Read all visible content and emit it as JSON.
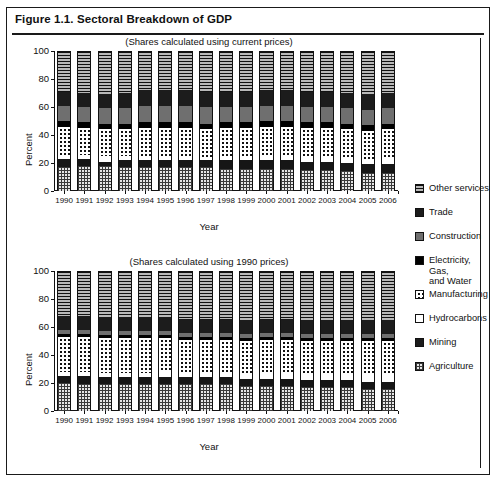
{
  "figure": {
    "title": "Figure 1.1. Sectoral Breakdown of GDP",
    "xlabel": "Year",
    "ylabel": "Percent"
  },
  "legend": {
    "title": "",
    "entries": [
      {
        "label": "Other services",
        "pattern": "horizontal-lines",
        "color": "#b9b9b9"
      },
      {
        "label": "Trade",
        "pattern": "solid-dark",
        "color": "#1c1c1c"
      },
      {
        "label": "Construction",
        "pattern": "solid-gray",
        "color": "#6f6f6f"
      },
      {
        "label": "Electricity, Gas,\nand Water",
        "pattern": "solid-black",
        "color": "#000000"
      },
      {
        "label": "Manufacturing",
        "pattern": "dots",
        "color": "#ffffff"
      },
      {
        "label": "Hydrocarbons",
        "pattern": "white",
        "color": "#ffffff"
      },
      {
        "label": "Mining",
        "pattern": "solid-dark",
        "color": "#161616"
      },
      {
        "label": "Agriculture",
        "pattern": "grid",
        "color": "#e6e6e6"
      }
    ]
  },
  "chart_data": [
    {
      "type": "bar",
      "stacked": true,
      "title": "(Shares calculated using current prices)",
      "xlabel": "Year",
      "ylabel": "Percent",
      "ylim": [
        0,
        100
      ],
      "yticks": [
        0,
        20,
        40,
        60,
        80,
        100
      ],
      "grid": false,
      "legend_position": "right",
      "categories": [
        "1990",
        "1991",
        "1992",
        "1993",
        "1994",
        "1995",
        "1996",
        "1997",
        "1998",
        "1999",
        "2000",
        "2001",
        "2002",
        "2003",
        "2004",
        "2005",
        "2006"
      ],
      "series": [
        {
          "name": "Agriculture",
          "values": [
            17,
            18,
            18,
            17,
            17,
            17,
            17,
            17,
            16,
            16,
            16,
            16,
            15,
            15,
            14,
            13,
            13
          ]
        },
        {
          "name": "Mining",
          "values": [
            6,
            5,
            3,
            5,
            5,
            5,
            5,
            5,
            6,
            6,
            6,
            6,
            6,
            6,
            6,
            6,
            6
          ]
        },
        {
          "name": "Hydrocarbons",
          "values": [
            3,
            3,
            4,
            3,
            3,
            3,
            3,
            2,
            2,
            2,
            3,
            3,
            3,
            3,
            4,
            4,
            5
          ]
        },
        {
          "name": "Manufacturing",
          "values": [
            20,
            19,
            19,
            19,
            20,
            20,
            20,
            20,
            21,
            21,
            21,
            21,
            21,
            21,
            20,
            20,
            20
          ]
        },
        {
          "name": "Electricity, Gas, and Water",
          "values": [
            4,
            4,
            4,
            4,
            4,
            4,
            4,
            4,
            4,
            4,
            4,
            4,
            4,
            4,
            4,
            4,
            4
          ]
        },
        {
          "name": "Construction",
          "values": [
            11,
            11,
            11,
            11,
            12,
            12,
            12,
            12,
            11,
            11,
            11,
            11,
            11,
            11,
            11,
            11,
            11
          ]
        },
        {
          "name": "Trade",
          "values": [
            10,
            10,
            10,
            11,
            11,
            11,
            11,
            11,
            11,
            11,
            11,
            11,
            11,
            11,
            11,
            11,
            11
          ]
        },
        {
          "name": "Other services",
          "values": [
            29,
            30,
            31,
            30,
            28,
            28,
            28,
            29,
            29,
            29,
            28,
            28,
            29,
            29,
            30,
            31,
            30
          ]
        }
      ]
    },
    {
      "type": "bar",
      "stacked": true,
      "title": "(Shares calculated using 1990 prices)",
      "xlabel": "Year",
      "ylabel": "Percent",
      "ylim": [
        0,
        100
      ],
      "yticks": [
        0,
        20,
        40,
        60,
        80,
        100
      ],
      "grid": false,
      "legend_position": "right",
      "categories": [
        "1990",
        "1991",
        "1992",
        "1993",
        "1994",
        "1995",
        "1996",
        "1997",
        "1998",
        "1999",
        "2000",
        "2001",
        "2002",
        "2003",
        "2004",
        "2005",
        "2006"
      ],
      "series": [
        {
          "name": "Agriculture",
          "values": [
            20,
            19,
            19,
            19,
            19,
            19,
            19,
            19,
            19,
            18,
            18,
            18,
            17,
            17,
            17,
            16,
            16
          ]
        },
        {
          "name": "Mining",
          "values": [
            5,
            6,
            5,
            5,
            5,
            5,
            5,
            5,
            5,
            5,
            5,
            5,
            5,
            5,
            5,
            5,
            5
          ]
        },
        {
          "name": "Hydrocarbons",
          "values": [
            3,
            3,
            3,
            3,
            3,
            4,
            3,
            3,
            3,
            3,
            4,
            4,
            4,
            4,
            4,
            5,
            5
          ]
        },
        {
          "name": "Manufacturing",
          "values": [
            25,
            25,
            25,
            25,
            25,
            24,
            24,
            24,
            24,
            24,
            24,
            24,
            24,
            24,
            24,
            24,
            24
          ]
        },
        {
          "name": "Electricity, Gas, and Water",
          "values": [
            2,
            2,
            2,
            2,
            2,
            2,
            2,
            2,
            2,
            2,
            2,
            2,
            2,
            2,
            2,
            2,
            2
          ]
        },
        {
          "name": "Construction",
          "values": [
            3,
            3,
            3,
            3,
            3,
            3,
            3,
            3,
            3,
            3,
            3,
            3,
            3,
            3,
            3,
            3,
            3
          ]
        },
        {
          "name": "Trade",
          "values": [
            10,
            10,
            10,
            10,
            10,
            10,
            10,
            10,
            10,
            10,
            10,
            10,
            10,
            10,
            10,
            10,
            10
          ]
        },
        {
          "name": "Other services",
          "values": [
            32,
            32,
            33,
            33,
            33,
            33,
            34,
            34,
            34,
            35,
            34,
            34,
            35,
            35,
            35,
            35,
            35
          ]
        }
      ]
    }
  ]
}
